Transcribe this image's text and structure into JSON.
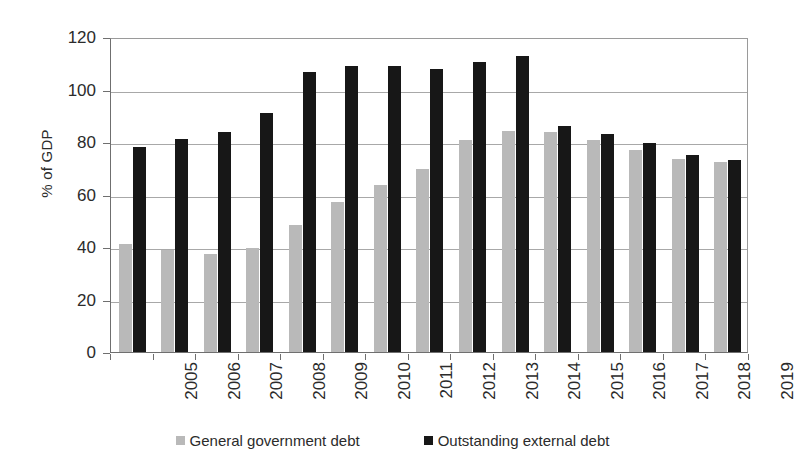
{
  "chart_data": {
    "type": "bar",
    "title": "",
    "xlabel": "",
    "ylabel": "% of GDP",
    "ylim": [
      0,
      120
    ],
    "yticks": [
      0,
      20,
      40,
      60,
      80,
      100,
      120
    ],
    "grid": true,
    "legend_position": "bottom",
    "categories": [
      "2005",
      "2006",
      "2007",
      "2008",
      "2009",
      "2010",
      "2011",
      "2012",
      "2013",
      "2014",
      "2015",
      "2016",
      "2017",
      "2018",
      "2019"
    ],
    "series": [
      {
        "name": "General government debt",
        "color": "#b9b9b9",
        "values": [
          41,
          38.7,
          37.3,
          39.5,
          48.3,
          57,
          63.8,
          69.8,
          80.9,
          84.3,
          83.7,
          80.6,
          77,
          73.5,
          72.3
        ]
      },
      {
        "name": "Outstanding external debt",
        "color": "#171717",
        "values": [
          78,
          81,
          83.8,
          91.2,
          106.5,
          109,
          109.1,
          108,
          110.6,
          112.7,
          86,
          83,
          79.6,
          75,
          73.3
        ]
      }
    ]
  },
  "axis": {
    "y_title": "% of GDP",
    "y_labels": [
      "120",
      "100",
      "80",
      "60",
      "40",
      "20",
      "0"
    ],
    "x_labels": [
      "2005",
      "2006",
      "2007",
      "2008",
      "2009",
      "2010",
      "2011",
      "2012",
      "2013",
      "2014",
      "2015",
      "2016",
      "2017",
      "2018",
      "2019"
    ]
  },
  "legend": {
    "items": [
      {
        "label": "General government debt",
        "color": "#b9b9b9"
      },
      {
        "label": "Outstanding external debt",
        "color": "#171717"
      }
    ]
  }
}
